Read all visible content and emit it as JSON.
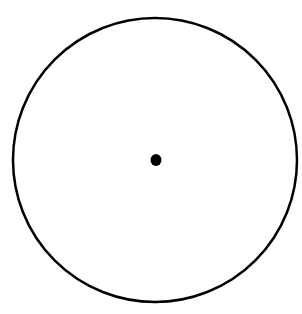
{
  "diagram": {
    "type": "circle-with-center-point",
    "width": 302,
    "height": 314,
    "background": "#ffffff",
    "circle": {
      "cx": 155,
      "cy": 160,
      "r": 142,
      "stroke": "#000000",
      "stroke_width": 2.5,
      "fill": "none"
    },
    "center_point": {
      "cx": 156,
      "cy": 160,
      "rx": 5.5,
      "ry": 6,
      "fill": "#000000"
    }
  }
}
